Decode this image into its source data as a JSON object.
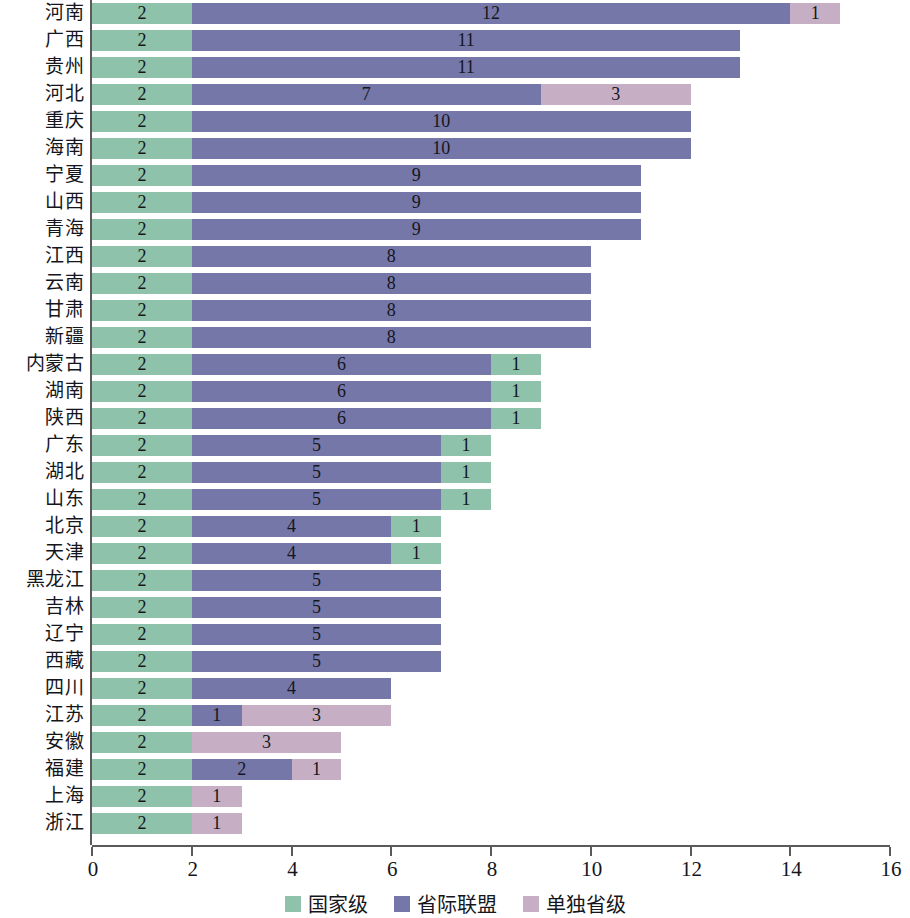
{
  "chart_data": {
    "type": "bar",
    "orientation": "horizontal",
    "stacked": true,
    "title": "",
    "xlabel": "",
    "ylabel": "",
    "xlim": [
      0,
      16
    ],
    "xticks": [
      "0",
      "2",
      "4",
      "6",
      "8",
      "10",
      "12",
      "14",
      "16"
    ],
    "grid": false,
    "legend_position": "bottom",
    "colors": {
      "national": "#8fc2aa",
      "interprovincial": "#7677a9",
      "provincial": "#c6afc4"
    },
    "series": [
      {
        "name": "国家级",
        "key": "national",
        "color": "#8fc2aa"
      },
      {
        "name": "省际联盟",
        "key": "interprovincial",
        "color": "#7677a9"
      },
      {
        "name": "单独省级",
        "key": "provincial",
        "color": "#c6afc4"
      }
    ],
    "categories": [
      "河南",
      "广西",
      "贵州",
      "河北",
      "重庆",
      "海南",
      "宁夏",
      "山西",
      "青海",
      "江西",
      "云南",
      "甘肃",
      "新疆",
      "内蒙古",
      "湖南",
      "陕西",
      "广东",
      "湖北",
      "山东",
      "北京",
      "天津",
      "黑龙江",
      "吉林",
      "辽宁",
      "西藏",
      "四川",
      "江苏",
      "安徽",
      "福建",
      "上海",
      "浙江"
    ],
    "rows": [
      {
        "label": "河南",
        "segments": [
          {
            "series": "国家级",
            "value": 2,
            "label": "2"
          },
          {
            "series": "省际联盟",
            "value": 12,
            "label": "12"
          },
          {
            "series": "单独省级",
            "value": 1,
            "label": "1"
          }
        ],
        "total": 15
      },
      {
        "label": "广西",
        "segments": [
          {
            "series": "国家级",
            "value": 2,
            "label": "2"
          },
          {
            "series": "省际联盟",
            "value": 11,
            "label": "11"
          }
        ],
        "total": 13
      },
      {
        "label": "贵州",
        "segments": [
          {
            "series": "国家级",
            "value": 2,
            "label": "2"
          },
          {
            "series": "省际联盟",
            "value": 11,
            "label": "11"
          }
        ],
        "total": 13
      },
      {
        "label": "河北",
        "segments": [
          {
            "series": "国家级",
            "value": 2,
            "label": "2"
          },
          {
            "series": "省际联盟",
            "value": 7,
            "label": "7"
          },
          {
            "series": "单独省级",
            "value": 3,
            "label": "3"
          }
        ],
        "total": 12
      },
      {
        "label": "重庆",
        "segments": [
          {
            "series": "国家级",
            "value": 2,
            "label": "2"
          },
          {
            "series": "省际联盟",
            "value": 10,
            "label": "10"
          }
        ],
        "total": 12
      },
      {
        "label": "海南",
        "segments": [
          {
            "series": "国家级",
            "value": 2,
            "label": "2"
          },
          {
            "series": "省际联盟",
            "value": 10,
            "label": "10"
          }
        ],
        "total": 12
      },
      {
        "label": "宁夏",
        "segments": [
          {
            "series": "国家级",
            "value": 2,
            "label": "2"
          },
          {
            "series": "省际联盟",
            "value": 9,
            "label": "9"
          }
        ],
        "total": 11
      },
      {
        "label": "山西",
        "segments": [
          {
            "series": "国家级",
            "value": 2,
            "label": "2"
          },
          {
            "series": "省际联盟",
            "value": 9,
            "label": "9"
          }
        ],
        "total": 11
      },
      {
        "label": "青海",
        "segments": [
          {
            "series": "国家级",
            "value": 2,
            "label": "2"
          },
          {
            "series": "省际联盟",
            "value": 9,
            "label": "9"
          }
        ],
        "total": 11
      },
      {
        "label": "江西",
        "segments": [
          {
            "series": "国家级",
            "value": 2,
            "label": "2"
          },
          {
            "series": "省际联盟",
            "value": 8,
            "label": "8"
          }
        ],
        "total": 10
      },
      {
        "label": "云南",
        "segments": [
          {
            "series": "国家级",
            "value": 2,
            "label": "2"
          },
          {
            "series": "省际联盟",
            "value": 8,
            "label": "8"
          }
        ],
        "total": 10
      },
      {
        "label": "甘肃",
        "segments": [
          {
            "series": "国家级",
            "value": 2,
            "label": "2"
          },
          {
            "series": "省际联盟",
            "value": 8,
            "label": "8"
          }
        ],
        "total": 10
      },
      {
        "label": "新疆",
        "segments": [
          {
            "series": "国家级",
            "value": 2,
            "label": "2"
          },
          {
            "series": "省际联盟",
            "value": 8,
            "label": "8"
          }
        ],
        "total": 10
      },
      {
        "label": "内蒙古",
        "segments": [
          {
            "series": "国家级",
            "value": 2,
            "label": "2"
          },
          {
            "series": "省际联盟",
            "value": 6,
            "label": "6"
          },
          {
            "series": "国家级",
            "value": 1,
            "label": "1"
          }
        ],
        "total": 9
      },
      {
        "label": "湖南",
        "segments": [
          {
            "series": "国家级",
            "value": 2,
            "label": "2"
          },
          {
            "series": "省际联盟",
            "value": 6,
            "label": "6"
          },
          {
            "series": "国家级",
            "value": 1,
            "label": "1"
          }
        ],
        "total": 9
      },
      {
        "label": "陕西",
        "segments": [
          {
            "series": "国家级",
            "value": 2,
            "label": "2"
          },
          {
            "series": "省际联盟",
            "value": 6,
            "label": "6"
          },
          {
            "series": "国家级",
            "value": 1,
            "label": "1"
          }
        ],
        "total": 9
      },
      {
        "label": "广东",
        "segments": [
          {
            "series": "国家级",
            "value": 2,
            "label": "2"
          },
          {
            "series": "省际联盟",
            "value": 5,
            "label": "5"
          },
          {
            "series": "国家级",
            "value": 1,
            "label": "1"
          }
        ],
        "total": 8
      },
      {
        "label": "湖北",
        "segments": [
          {
            "series": "国家级",
            "value": 2,
            "label": "2"
          },
          {
            "series": "省际联盟",
            "value": 5,
            "label": "5"
          },
          {
            "series": "国家级",
            "value": 1,
            "label": "1"
          }
        ],
        "total": 8
      },
      {
        "label": "山东",
        "segments": [
          {
            "series": "国家级",
            "value": 2,
            "label": "2"
          },
          {
            "series": "省际联盟",
            "value": 5,
            "label": "5"
          },
          {
            "series": "国家级",
            "value": 1,
            "label": "1"
          }
        ],
        "total": 8
      },
      {
        "label": "北京",
        "segments": [
          {
            "series": "国家级",
            "value": 2,
            "label": "2"
          },
          {
            "series": "省际联盟",
            "value": 4,
            "label": "4"
          },
          {
            "series": "国家级",
            "value": 1,
            "label": "1"
          }
        ],
        "total": 7
      },
      {
        "label": "天津",
        "segments": [
          {
            "series": "国家级",
            "value": 2,
            "label": "2"
          },
          {
            "series": "省际联盟",
            "value": 4,
            "label": "4"
          },
          {
            "series": "国家级",
            "value": 1,
            "label": "1"
          }
        ],
        "total": 7
      },
      {
        "label": "黑龙江",
        "segments": [
          {
            "series": "国家级",
            "value": 2,
            "label": "2"
          },
          {
            "series": "省际联盟",
            "value": 5,
            "label": "5"
          }
        ],
        "total": 7
      },
      {
        "label": "吉林",
        "segments": [
          {
            "series": "国家级",
            "value": 2,
            "label": "2"
          },
          {
            "series": "省际联盟",
            "value": 5,
            "label": "5"
          }
        ],
        "total": 7
      },
      {
        "label": "辽宁",
        "segments": [
          {
            "series": "国家级",
            "value": 2,
            "label": "2"
          },
          {
            "series": "省际联盟",
            "value": 5,
            "label": "5"
          }
        ],
        "total": 7
      },
      {
        "label": "西藏",
        "segments": [
          {
            "series": "国家级",
            "value": 2,
            "label": "2"
          },
          {
            "series": "省际联盟",
            "value": 5,
            "label": "5"
          }
        ],
        "total": 7
      },
      {
        "label": "四川",
        "segments": [
          {
            "series": "国家级",
            "value": 2,
            "label": "2"
          },
          {
            "series": "省际联盟",
            "value": 4,
            "label": "4"
          }
        ],
        "total": 6
      },
      {
        "label": "江苏",
        "segments": [
          {
            "series": "国家级",
            "value": 2,
            "label": "2"
          },
          {
            "series": "省际联盟",
            "value": 1,
            "label": "1"
          },
          {
            "series": "单独省级",
            "value": 3,
            "label": "3"
          }
        ],
        "total": 6
      },
      {
        "label": "安徽",
        "segments": [
          {
            "series": "国家级",
            "value": 2,
            "label": "2"
          },
          {
            "series": "单独省级",
            "value": 3,
            "label": "3"
          }
        ],
        "total": 5
      },
      {
        "label": "福建",
        "segments": [
          {
            "series": "国家级",
            "value": 2,
            "label": "2"
          },
          {
            "series": "省际联盟",
            "value": 2,
            "label": "2"
          },
          {
            "series": "单独省级",
            "value": 1,
            "label": "1"
          }
        ],
        "total": 5
      },
      {
        "label": "上海",
        "segments": [
          {
            "series": "国家级",
            "value": 2,
            "label": "2"
          },
          {
            "series": "单独省级",
            "value": 1,
            "label": "1"
          }
        ],
        "total": 3
      },
      {
        "label": "浙江",
        "segments": [
          {
            "series": "国家级",
            "value": 2,
            "label": "2"
          },
          {
            "series": "单独省级",
            "value": 1,
            "label": "1"
          }
        ],
        "total": 3
      }
    ]
  }
}
